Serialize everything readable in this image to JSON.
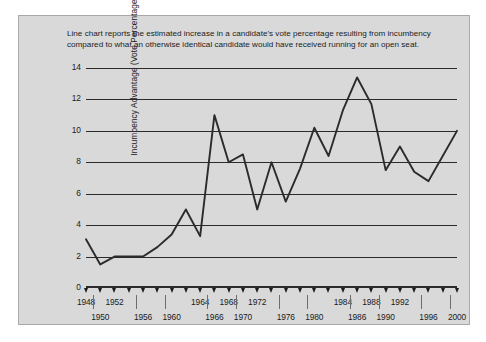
{
  "figure": {
    "caption": "Line chart reports the estimated increase in a candidate's vote percentage resulting from incumbency compared to what an otherwise identical candidate would have received running for an open seat.",
    "panel_background": "#d9d9d9",
    "line_color": "#2b2b2b",
    "grid_color": "#2b2b2b",
    "text_color": "#1b1b1b"
  },
  "chart_data": {
    "type": "line",
    "title": "",
    "xlabel": "",
    "ylabel": "Incumbency Advantage (Vote Percentage)",
    "xlim": [
      1948,
      2000
    ],
    "ylim": [
      0,
      14
    ],
    "grid": "horizontal",
    "legend": "none",
    "yticks": [
      0,
      2,
      4,
      6,
      8,
      10,
      12,
      14
    ],
    "ytick_labels": [
      "0",
      "2",
      "4",
      "6",
      "8",
      "10",
      "12",
      "14"
    ],
    "x": [
      1948,
      1950,
      1952,
      1954,
      1956,
      1958,
      1960,
      1962,
      1964,
      1966,
      1968,
      1970,
      1972,
      1974,
      1976,
      1978,
      1980,
      1982,
      1984,
      1986,
      1988,
      1990,
      1992,
      1994,
      1996,
      1998,
      2000
    ],
    "xtick_labels": [
      "1948",
      "1950",
      "1952",
      "1954",
      "1956",
      "1958",
      "1960",
      "1962",
      "1964",
      "1966",
      "1968",
      "1970",
      "1972",
      "1974",
      "1976",
      "1978",
      "1980",
      "1982",
      "1984",
      "1986",
      "1988",
      "1990",
      "1992",
      "1994",
      "1996",
      "1998",
      "2000"
    ],
    "xtick_label_rows": [
      "top",
      "bottom",
      "top",
      "top",
      "bottom",
      "top",
      "bottom",
      "top",
      "top",
      "bottom",
      "top",
      "bottom",
      "top",
      "top",
      "bottom",
      "top",
      "bottom",
      "top",
      "top",
      "bottom",
      "top",
      "bottom",
      "top",
      "top",
      "bottom",
      "top",
      "bottom"
    ],
    "values": [
      3.1,
      1.5,
      2.0,
      2.0,
      2.0,
      2.6,
      3.4,
      5.0,
      3.3,
      11.0,
      8.0,
      8.5,
      5.0,
      8.0,
      5.5,
      7.6,
      10.2,
      8.4,
      11.3,
      13.4,
      11.7,
      7.5,
      9.0,
      7.4,
      6.8,
      8.4,
      10.0
    ],
    "series": [
      {
        "name": "Incumbency advantage",
        "values": [
          3.1,
          1.5,
          2.0,
          2.0,
          2.0,
          2.6,
          3.4,
          5.0,
          3.3,
          11.0,
          8.0,
          8.5,
          5.0,
          8.0,
          5.5,
          7.6,
          10.2,
          8.4,
          11.3,
          13.4,
          11.7,
          7.5,
          9.0,
          7.4,
          6.8,
          8.4,
          10.0
        ]
      }
    ]
  }
}
